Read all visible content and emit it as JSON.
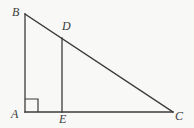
{
  "figure": {
    "type": "geometry-diagram",
    "canvas": {
      "width": 194,
      "height": 128,
      "background": "#f8f8f6"
    },
    "stroke": {
      "color": "#3b3b3b",
      "width": 1.3
    },
    "points": {
      "A": {
        "label": "A",
        "x": 25,
        "y": 112,
        "label_x": 11,
        "label_y": 108
      },
      "B": {
        "label": "B",
        "x": 25,
        "y": 14,
        "label_x": 12,
        "label_y": 6
      },
      "C": {
        "label": "C",
        "x": 173,
        "y": 112,
        "label_x": 175,
        "label_y": 110
      },
      "D": {
        "label": "D",
        "x": 62,
        "y": 38,
        "label_x": 62,
        "label_y": 20
      },
      "E": {
        "label": "E",
        "x": 62,
        "y": 112,
        "label_x": 59,
        "label_y": 113
      }
    },
    "segments": [
      {
        "name": "AB",
        "from": "A",
        "to": "B"
      },
      {
        "name": "AC",
        "from": "A",
        "to": "C"
      },
      {
        "name": "BC",
        "from": "B",
        "to": "C"
      },
      {
        "name": "DE",
        "from": "D",
        "to": "E"
      }
    ],
    "right_angle_marker": {
      "at": "A",
      "size": 13,
      "x": 25,
      "y": 99
    }
  }
}
